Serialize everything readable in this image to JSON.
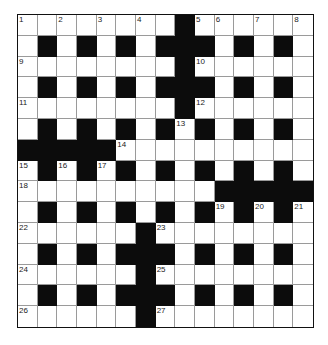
{
  "puzzle": {
    "type": "crossword",
    "rows": 15,
    "cols": 15,
    "grid": [
      "00000000100000 0",
      "0101010111010101",
      "00000000100000 0"
    ],
    "layout": [
      [
        0,
        0,
        0,
        0,
        0,
        0,
        0,
        0,
        1,
        0,
        0,
        0,
        0,
        0,
        0
      ],
      [
        0,
        1,
        0,
        1,
        0,
        1,
        0,
        1,
        1,
        1,
        0,
        1,
        0,
        1,
        0
      ],
      [
        0,
        0,
        0,
        0,
        0,
        0,
        0,
        0,
        1,
        0,
        0,
        0,
        0,
        0,
        0
      ],
      [
        0,
        1,
        0,
        1,
        0,
        1,
        0,
        1,
        1,
        1,
        0,
        1,
        0,
        1,
        0
      ],
      [
        0,
        0,
        0,
        0,
        0,
        0,
        0,
        0,
        1,
        0,
        0,
        0,
        0,
        0,
        0
      ],
      [
        0,
        1,
        0,
        1,
        0,
        1,
        0,
        1,
        0,
        1,
        0,
        1,
        0,
        1,
        0
      ],
      [
        1,
        1,
        1,
        1,
        1,
        0,
        0,
        0,
        0,
        0,
        0,
        0,
        0,
        0,
        0
      ],
      [
        0,
        1,
        0,
        1,
        0,
        1,
        0,
        1,
        0,
        1,
        0,
        1,
        0,
        1,
        0
      ],
      [
        0,
        0,
        0,
        0,
        0,
        0,
        0,
        0,
        0,
        0,
        1,
        1,
        1,
        1,
        1
      ],
      [
        0,
        1,
        0,
        1,
        0,
        1,
        0,
        1,
        0,
        1,
        0,
        1,
        0,
        1,
        0
      ],
      [
        0,
        0,
        0,
        0,
        0,
        0,
        1,
        0,
        0,
        0,
        0,
        0,
        0,
        0,
        0
      ],
      [
        0,
        1,
        0,
        1,
        0,
        1,
        1,
        1,
        0,
        1,
        0,
        1,
        0,
        1,
        0
      ],
      [
        0,
        0,
        0,
        0,
        0,
        0,
        1,
        0,
        0,
        0,
        0,
        0,
        0,
        0,
        0
      ],
      [
        0,
        1,
        0,
        1,
        0,
        1,
        1,
        1,
        0,
        1,
        0,
        1,
        0,
        1,
        0
      ],
      [
        0,
        0,
        0,
        0,
        0,
        0,
        1,
        0,
        0,
        0,
        0,
        0,
        0,
        0,
        0
      ]
    ],
    "numbers": [
      {
        "n": "1",
        "r": 0,
        "c": 0
      },
      {
        "n": "2",
        "r": 0,
        "c": 2
      },
      {
        "n": "3",
        "r": 0,
        "c": 4
      },
      {
        "n": "4",
        "r": 0,
        "c": 6
      },
      {
        "n": "5",
        "r": 0,
        "c": 9
      },
      {
        "n": "6",
        "r": 0,
        "c": 10
      },
      {
        "n": "7",
        "r": 0,
        "c": 12
      },
      {
        "n": "8",
        "r": 0,
        "c": 14
      },
      {
        "n": "9",
        "r": 2,
        "c": 0
      },
      {
        "n": "10",
        "r": 2,
        "c": 9
      },
      {
        "n": "11",
        "r": 4,
        "c": 0
      },
      {
        "n": "12",
        "r": 4,
        "c": 9
      },
      {
        "n": "13",
        "r": 5,
        "c": 8
      },
      {
        "n": "14",
        "r": 6,
        "c": 5
      },
      {
        "n": "15",
        "r": 7,
        "c": 0
      },
      {
        "n": "16",
        "r": 7,
        "c": 2
      },
      {
        "n": "17",
        "r": 7,
        "c": 4
      },
      {
        "n": "18",
        "r": 8,
        "c": 0
      },
      {
        "n": "19",
        "r": 9,
        "c": 10
      },
      {
        "n": "20",
        "r": 9,
        "c": 12
      },
      {
        "n": "21",
        "r": 9,
        "c": 14
      },
      {
        "n": "22",
        "r": 10,
        "c": 0
      },
      {
        "n": "23",
        "r": 10,
        "c": 7
      },
      {
        "n": "24",
        "r": 12,
        "c": 0
      },
      {
        "n": "25",
        "r": 12,
        "c": 7
      },
      {
        "n": "26",
        "r": 14,
        "c": 0
      },
      {
        "n": "27",
        "r": 14,
        "c": 7
      }
    ],
    "colors": {
      "black_cell": "#0c0c0c",
      "white_cell": "#ffffff",
      "grid_line": "#9a9a9a",
      "border": "#111111"
    }
  }
}
